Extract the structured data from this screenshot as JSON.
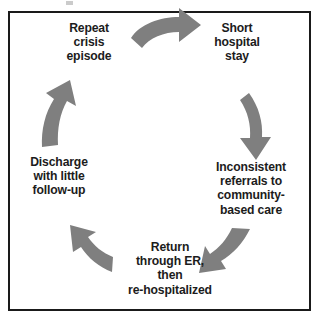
{
  "diagram": {
    "type": "cycle",
    "direction": "clockwise",
    "frame": {
      "border_color": "#1a1a1a",
      "background": "#ffffff"
    },
    "arrow_color": "#7f7f7f",
    "text_color": "#1c1c1c",
    "nodes": [
      {
        "id": "repeat-crisis",
        "label": "Repeat\ncrisis\nepisode"
      },
      {
        "id": "short-hospital",
        "label": "Short\nhospital\nstay"
      },
      {
        "id": "inconsistent",
        "label": "Inconsistent\nreferrals to\ncommunity-\nbased care"
      },
      {
        "id": "return-er",
        "label": "Return\nthrough ER,\nthen\nre-hospitalized"
      },
      {
        "id": "discharge",
        "label": "Discharge\nwith little\nfollow-up"
      }
    ],
    "arrows": [
      {
        "id": "arrow-top",
        "from": "repeat-crisis",
        "to": "short-hospital"
      },
      {
        "id": "arrow-right",
        "from": "short-hospital",
        "to": "inconsistent"
      },
      {
        "id": "arrow-bottom-right",
        "from": "inconsistent",
        "to": "return-er"
      },
      {
        "id": "arrow-bottom-left",
        "from": "return-er",
        "to": "discharge"
      },
      {
        "id": "arrow-left",
        "from": "discharge",
        "to": "repeat-crisis"
      }
    ]
  }
}
